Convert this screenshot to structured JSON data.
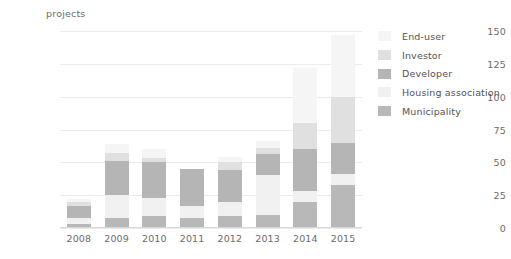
{
  "chart_data": {
    "type": "bar",
    "stacked": true,
    "title": "",
    "subtitle": "",
    "xlabel": "",
    "ylabel": "projects",
    "ylim": [
      0,
      150
    ],
    "yticks": [
      0,
      25,
      50,
      75,
      100,
      125,
      150
    ],
    "grid": true,
    "legend_position": "right",
    "categories": [
      "2008",
      "2009",
      "2010",
      "2011",
      "2012",
      "2013",
      "2014",
      "2015"
    ],
    "series": [
      {
        "name": "Municipality",
        "color": "#b8b8b8",
        "values": [
          3,
          8,
          9,
          8,
          9,
          10,
          20,
          33
        ]
      },
      {
        "name": "Housing association",
        "color": "#f1f1f1",
        "values": [
          5,
          17,
          14,
          9,
          11,
          30,
          8,
          8
        ]
      },
      {
        "name": "Developer",
        "color": "#b5b5b5",
        "values": [
          9,
          26,
          27,
          28,
          24,
          16,
          32,
          24
        ]
      },
      {
        "name": "Investor",
        "color": "#e0e0e0",
        "values": [
          3,
          6,
          3,
          0,
          6,
          5,
          20,
          35
        ]
      },
      {
        "name": "End-user",
        "color": "#f5f5f5",
        "values": [
          2,
          7,
          7,
          0,
          4,
          5,
          42,
          47
        ]
      }
    ],
    "totals": [
      22,
      64,
      60,
      45,
      54,
      66,
      122,
      147
    ]
  },
  "legend": {
    "items": [
      {
        "label": "End-user",
        "color": "#f5f5f5"
      },
      {
        "label": "Investor",
        "color": "#e0e0e0"
      },
      {
        "label": "Developer",
        "color": "#b5b5b5"
      },
      {
        "label": "Housing association",
        "color": "#f1f1f1"
      },
      {
        "label": "Municipality",
        "color": "#b8b8b8"
      }
    ]
  },
  "style": {
    "background": "#ffffff",
    "grid_color": "#eceaea",
    "tick_text_color": "#6e6b6b",
    "legend_text_color": "#555353"
  }
}
